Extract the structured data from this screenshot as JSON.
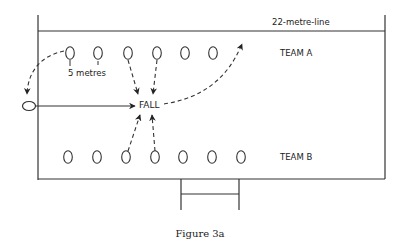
{
  "figure": {
    "caption": "Figure 3a",
    "line_label": "22-metre-line",
    "team_a_label": "TEAM A",
    "team_b_label": "TEAM B",
    "fall_label": "FALL",
    "distance_label": "5 metres"
  },
  "team_a_players": [
    {
      "x": 70,
      "y": 53
    },
    {
      "x": 98,
      "y": 53
    },
    {
      "x": 128,
      "y": 53
    },
    {
      "x": 157,
      "y": 53
    },
    {
      "x": 185,
      "y": 53
    },
    {
      "x": 213,
      "y": 53
    }
  ],
  "team_b_players": [
    {
      "x": 68,
      "y": 157
    },
    {
      "x": 97,
      "y": 157
    },
    {
      "x": 126,
      "y": 157
    },
    {
      "x": 155,
      "y": 157
    },
    {
      "x": 183,
      "y": 157
    },
    {
      "x": 212,
      "y": 157
    },
    {
      "x": 241,
      "y": 157
    }
  ],
  "thrower": {
    "x": 28,
    "y": 106
  },
  "colors": {
    "ink": "#222222",
    "background": "#ffffff"
  }
}
